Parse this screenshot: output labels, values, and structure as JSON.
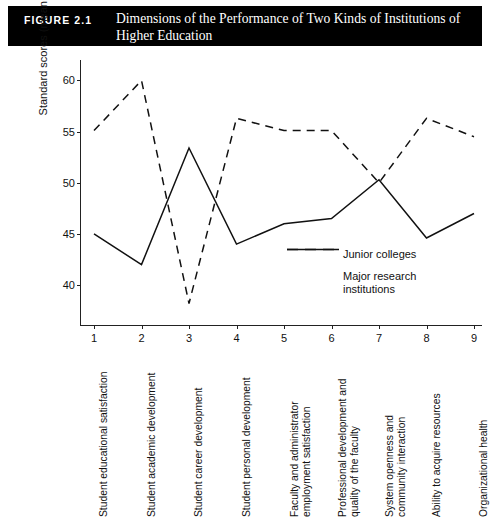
{
  "banner": {
    "figure_number": "FIGURE 2.1",
    "title": "Dimensions of the Performance of Two Kinds of Institutions of Higher Education"
  },
  "chart_data": {
    "type": "line",
    "title": "Dimensions of the Performance of Two Kinds of Institutions of Higher Education",
    "xlabel": "",
    "ylabel": "Standard scores (mean = 50)",
    "ylim": [
      36,
      62
    ],
    "yticks": [
      40,
      45,
      50,
      55,
      60
    ],
    "grid": false,
    "legend_position": "inside-center-right",
    "x": [
      1,
      2,
      3,
      4,
      5,
      6,
      7,
      8,
      9
    ],
    "xtick_labels": [
      "1",
      "2",
      "3",
      "4",
      "5",
      "6",
      "7",
      "8",
      "9"
    ],
    "categories": [
      "Student educational satisfaction",
      "Student academic development",
      "Student career development",
      "Student personal development",
      "Faculty and administrator employment satisfaction",
      "Professional development and quality of the faculty",
      "System openness and community interaction",
      "Ability to acquire resources",
      "Organizational health"
    ],
    "category_lines": [
      [
        "Student educational satisfaction"
      ],
      [
        "Student academic development"
      ],
      [
        "Student career development"
      ],
      [
        "Student personal development"
      ],
      [
        "Faculty and administrator",
        "employment satisfaction"
      ],
      [
        "Professional development and",
        "quality of the faculty"
      ],
      [
        "System openness and",
        "community interaction"
      ],
      [
        "Ability to acquire resources"
      ],
      [
        "Organizational health"
      ]
    ],
    "series": [
      {
        "name": "Junior colleges",
        "style": "solid",
        "color": "#111111",
        "values": [
          45.0,
          42.0,
          53.4,
          44.0,
          46.0,
          46.5,
          50.3,
          44.6,
          47.0
        ]
      },
      {
        "name": "Major research institutions",
        "style": "dashed",
        "color": "#111111",
        "name_lines": [
          "Major research",
          "institutions"
        ],
        "values": [
          55.1,
          60.0,
          38.2,
          56.3,
          55.1,
          55.1,
          50.0,
          56.3,
          54.5
        ]
      }
    ]
  }
}
